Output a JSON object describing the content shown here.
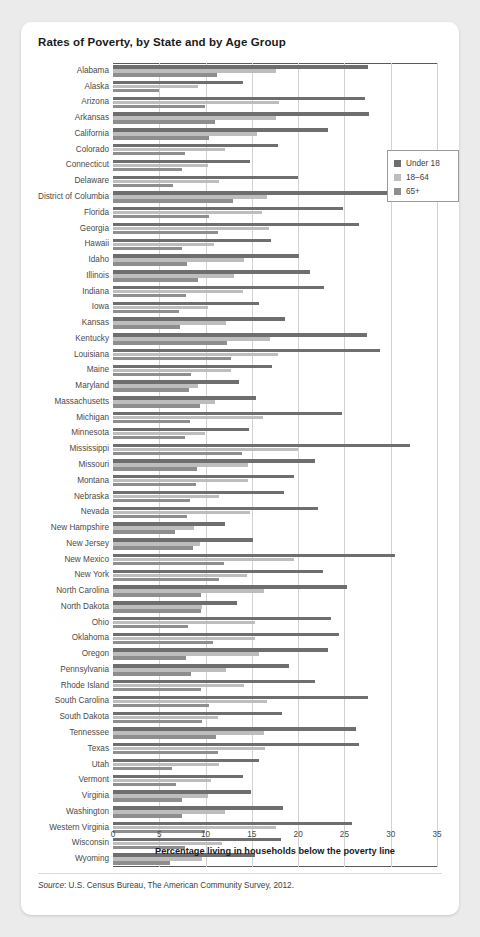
{
  "card": {
    "title": "Rates of Poverty, by State and by Age Group",
    "source_prefix": "Source",
    "source_text": ": U.S. Census Bureau, The American Community Survey, 2012."
  },
  "legend": {
    "position": "inside-top-right",
    "entries": [
      {
        "label": "Under 18",
        "color": "#6e6e6e"
      },
      {
        "label": "18–64",
        "color": "#bdbdbd"
      },
      {
        "label": "65+",
        "color": "#8e8e8e"
      }
    ]
  },
  "chart_data": {
    "type": "bar",
    "orientation": "horizontal",
    "grouped": true,
    "title": "Rates of Poverty, by State and by Age Group",
    "xlabel": "Percentage living in households below the poverty line",
    "ylabel": "",
    "xlim": [
      0,
      35
    ],
    "xticks": [
      0,
      5,
      10,
      15,
      20,
      25,
      30,
      35
    ],
    "grid": "vertical",
    "categories": [
      "Alabama",
      "Alaska",
      "Arizona",
      "Arkansas",
      "California",
      "Colorado",
      "Connecticut",
      "Delaware",
      "District of Columbia",
      "Florida",
      "Georgia",
      "Hawaii",
      "Idaho",
      "Illinois",
      "Indiana",
      "Iowa",
      "Kansas",
      "Kentucky",
      "Louisiana",
      "Maine",
      "Maryland",
      "Massachusetts",
      "Michigan",
      "Minnesota",
      "Mississippi",
      "Missouri",
      "Montana",
      "Nebraska",
      "Nevada",
      "New Hampshire",
      "New Jersey",
      "New Mexico",
      "New York",
      "North Carolina",
      "North Dakota",
      "Ohio",
      "Oklahoma",
      "Oregon",
      "Pennsylvania",
      "Rhode Island",
      "South Carolina",
      "South Dakota",
      "Tennessee",
      "Texas",
      "Utah",
      "Vermont",
      "Virginia",
      "Washington",
      "Western Virginia",
      "Wisconsin",
      "Wyoming"
    ],
    "series": [
      {
        "name": "Under 18",
        "color": "#6e6e6e",
        "values": [
          27.6,
          14.0,
          27.2,
          27.7,
          23.2,
          17.8,
          14.8,
          20.0,
          30.3,
          24.8,
          26.6,
          17.1,
          20.1,
          21.3,
          22.8,
          15.8,
          18.6,
          27.4,
          28.8,
          17.2,
          13.6,
          15.4,
          24.7,
          14.7,
          32.1,
          21.8,
          19.6,
          18.5,
          22.1,
          12.1,
          15.1,
          30.5,
          22.7,
          25.3,
          13.4,
          23.6,
          24.4,
          23.2,
          19.0,
          21.8,
          27.6,
          18.3,
          26.2,
          26.6,
          15.8,
          14.0,
          14.9,
          18.4,
          25.8,
          18.1,
          15.3
        ]
      },
      {
        "name": "18–64",
        "color": "#bdbdbd",
        "values": [
          17.6,
          9.2,
          17.9,
          17.6,
          15.6,
          12.1,
          10.3,
          11.5,
          16.6,
          16.1,
          16.8,
          10.9,
          14.2,
          13.1,
          14.0,
          10.3,
          12.2,
          17.0,
          17.8,
          12.7,
          9.2,
          11.0,
          16.2,
          9.9,
          20.0,
          14.6,
          14.6,
          11.5,
          14.8,
          8.8,
          9.4,
          19.5,
          14.5,
          16.3,
          9.6,
          15.3,
          15.3,
          15.8,
          12.2,
          14.1,
          16.6,
          11.3,
          16.3,
          16.4,
          11.4,
          10.6,
          10.3,
          12.1,
          17.6,
          11.8,
          9.6
        ]
      },
      {
        "name": "65+",
        "color": "#8e8e8e",
        "values": [
          11.2,
          5.0,
          9.9,
          11.0,
          10.4,
          7.8,
          7.4,
          6.5,
          13.0,
          10.4,
          11.3,
          7.4,
          8.0,
          9.2,
          7.9,
          7.1,
          7.2,
          12.3,
          12.8,
          8.4,
          8.2,
          9.4,
          8.3,
          7.8,
          13.9,
          9.1,
          9.0,
          8.3,
          8.0,
          6.7,
          8.6,
          12.0,
          11.5,
          9.5,
          9.5,
          8.1,
          10.8,
          7.9,
          8.4,
          9.5,
          10.4,
          9.6,
          11.1,
          11.3,
          6.4,
          6.8,
          7.4,
          7.4,
          9.9,
          7.8,
          6.2
        ]
      }
    ]
  }
}
